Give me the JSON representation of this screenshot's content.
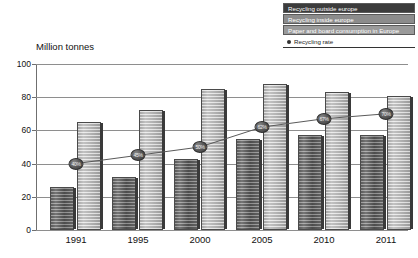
{
  "axis_title": "Million tonnes",
  "legend": {
    "items": [
      {
        "label": "Recycling outside europe",
        "color": "#3c3c3c"
      },
      {
        "label": "Recycling inside europe",
        "color": "#8c8c8c"
      },
      {
        "label": "Paper and board consumption in Europe",
        "color": "#9a9a9a"
      }
    ],
    "rate_label": "Recycling rate",
    "rate_marker_icon": "filled-circle-marker"
  },
  "chart_data": {
    "type": "bar",
    "title": "",
    "subtitle": "",
    "xlabel": "",
    "ylabel": "Million tonnes",
    "ylim": [
      0,
      100
    ],
    "yticks": [
      0,
      20,
      40,
      60,
      80,
      100
    ],
    "ytick_labels": [
      "0",
      "20",
      "40",
      "60",
      "80",
      "100"
    ],
    "grid": true,
    "legend_position": "top-right",
    "categories": [
      "1991",
      "1995",
      "2000",
      "2005",
      "2010",
      "2011"
    ],
    "series": [
      {
        "name": "Recycling outside europe",
        "type": "bar",
        "values": [
          26,
          32,
          43,
          55,
          57,
          57
        ]
      },
      {
        "name": "Paper and board consumption in Europe",
        "type": "bar",
        "values": [
          65,
          72,
          85,
          88,
          83,
          81
        ]
      },
      {
        "name": "Recycling rate",
        "type": "line",
        "unit": "%",
        "values": [
          40,
          45,
          50,
          62,
          67,
          70
        ],
        "labels": [
          "40%",
          "45%",
          "50%",
          "62%",
          "67%",
          "70%"
        ]
      }
    ],
    "annotations": [
      {
        "text": "40%",
        "category": "1991"
      },
      {
        "text": "45%",
        "category": "1995"
      },
      {
        "text": "50%",
        "category": "2000"
      },
      {
        "text": "62%",
        "category": "2005"
      },
      {
        "text": "67%",
        "category": "2010"
      },
      {
        "text": "70%",
        "category": "2011"
      }
    ]
  }
}
